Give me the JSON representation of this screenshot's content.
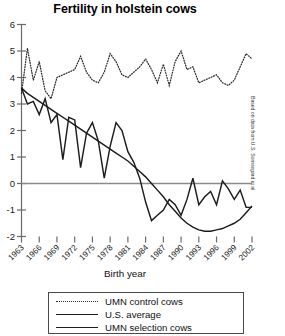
{
  "chart_data": {
    "type": "line",
    "title": "Fertility in holstein cows",
    "xlabel": "Birth year",
    "ylabel": "",
    "annotation": "Based on data from U.S. Sonstegard et al",
    "grid": false,
    "legend_position": "bottom",
    "xlim": [
      1963,
      2002
    ],
    "ylim": [
      -2,
      6
    ],
    "yticks": [
      "6",
      "5",
      "4",
      "3",
      "2",
      "1",
      "0",
      "-1",
      "-2"
    ],
    "ytick_values": [
      6,
      5,
      4,
      3,
      2,
      1,
      0,
      -1,
      -2
    ],
    "xticks": [
      "1963",
      "1966",
      "1969",
      "1972",
      "1975",
      "1978",
      "1981",
      "1984",
      "1987",
      "1990",
      "1993",
      "1996",
      "1999",
      "2002"
    ],
    "xtick_values": [
      1963,
      1966,
      1969,
      1972,
      1975,
      1978,
      1981,
      1984,
      1987,
      1990,
      1993,
      1996,
      1999,
      2002
    ],
    "zero_line": 0,
    "x": [
      1963,
      1964,
      1965,
      1966,
      1967,
      1968,
      1969,
      1970,
      1971,
      1972,
      1973,
      1974,
      1975,
      1976,
      1977,
      1978,
      1979,
      1980,
      1981,
      1982,
      1983,
      1984,
      1985,
      1986,
      1987,
      1988,
      1989,
      1990,
      1991,
      1992,
      1993,
      1994,
      1995,
      1996,
      1997,
      1998,
      1999,
      2000,
      2001,
      2002
    ],
    "series": [
      {
        "name": "UMN control cows",
        "style": "dotted",
        "color": "#2b2b2b",
        "values": [
          3.4,
          5.1,
          3.9,
          4.6,
          3.5,
          3.2,
          4.0,
          4.1,
          4.2,
          4.3,
          4.8,
          4.2,
          3.9,
          3.8,
          4.2,
          4.9,
          4.6,
          4.1,
          4.0,
          4.2,
          4.4,
          4.7,
          4.3,
          3.8,
          4.5,
          3.7,
          4.6,
          5.0,
          4.3,
          4.4,
          3.8,
          3.9,
          4.0,
          4.1,
          3.8,
          3.7,
          3.9,
          4.4,
          4.9,
          4.7
        ]
      },
      {
        "name": "U.S. average",
        "style": "solid",
        "color": "#1c1c1c",
        "values": [
          3.6,
          3.4,
          3.25,
          3.1,
          2.95,
          2.8,
          2.65,
          2.5,
          2.35,
          2.2,
          2.05,
          1.9,
          1.75,
          1.6,
          1.45,
          1.3,
          1.15,
          1.0,
          0.85,
          0.65,
          0.45,
          0.25,
          0.0,
          -0.25,
          -0.5,
          -0.8,
          -1.05,
          -1.3,
          -1.5,
          -1.65,
          -1.75,
          -1.8,
          -1.8,
          -1.75,
          -1.7,
          -1.6,
          -1.5,
          -1.35,
          -1.1,
          -0.85
        ]
      },
      {
        "name": "UMN selection cows",
        "style": "solid",
        "color": "#1c1c1c",
        "values": [
          3.6,
          3.0,
          3.1,
          2.6,
          3.2,
          2.3,
          2.6,
          0.9,
          2.5,
          2.4,
          0.6,
          1.9,
          2.3,
          1.6,
          0.2,
          1.4,
          2.3,
          2.0,
          1.2,
          0.8,
          0.2,
          -0.7,
          -1.4,
          -1.2,
          -1.0,
          -0.6,
          -0.8,
          -1.2,
          -0.6,
          0.2,
          -0.8,
          -0.5,
          -0.3,
          -0.8,
          0.1,
          -0.2,
          -0.6,
          -0.25,
          -0.9,
          -0.9
        ]
      }
    ]
  },
  "legend": {
    "items": [
      {
        "label": "UMN control cows",
        "style": "dotted"
      },
      {
        "label": "U.S. average",
        "style": "solid"
      },
      {
        "label": "UMN selection cows",
        "style": "solid"
      }
    ]
  }
}
